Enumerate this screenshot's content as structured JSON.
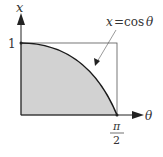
{
  "diagram": {
    "axes": {
      "vertical_label": "x",
      "horizontal_label": "θ",
      "y_tick_label": "1",
      "x_tick_numerator": "π",
      "x_tick_denominator": "2"
    },
    "curve_label": {
      "lhs": "x",
      "eq": "=",
      "rhs_fn": "cos",
      "rhs_var": "θ"
    },
    "colors": {
      "fill": "#d2d2d2",
      "curve": "#1a1a1a",
      "axis": "#222222",
      "rect": "#555555"
    }
  }
}
